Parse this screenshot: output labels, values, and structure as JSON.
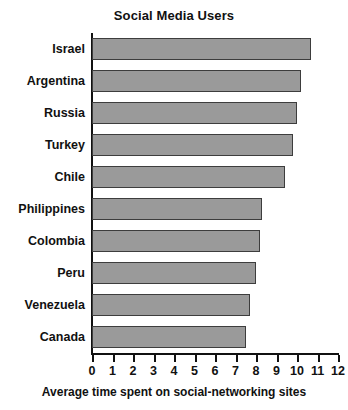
{
  "chart_data": {
    "type": "bar",
    "orientation": "horizontal",
    "title": "Social Media Users",
    "xlabel": "Average time spent on social-networking sites",
    "ylabel": "",
    "xlim": [
      0,
      12
    ],
    "xticks": [
      0,
      1,
      2,
      3,
      4,
      5,
      6,
      7,
      8,
      9,
      10,
      11,
      12
    ],
    "xtick_labels": [
      "0",
      "1",
      "2",
      "3",
      "4",
      "5",
      "6",
      "7",
      "8",
      "9",
      "10",
      "11",
      "12"
    ],
    "grid": false,
    "legend": false,
    "bar_color": "#9a9a9a",
    "bar_edge_color": "#3d3d3d",
    "categories": [
      "Israel",
      "Argentina",
      "Russia",
      "Turkey",
      "Chile",
      "Philippines",
      "Colombia",
      "Peru",
      "Venezuela",
      "Canada"
    ],
    "values": [
      10.7,
      10.2,
      10.0,
      9.8,
      9.4,
      8.3,
      8.2,
      8.0,
      7.7,
      7.5
    ],
    "bars": [
      {
        "label": "Israel",
        "value": 10.7
      },
      {
        "label": "Argentina",
        "value": 10.2
      },
      {
        "label": "Russia",
        "value": 10.0
      },
      {
        "label": "Turkey",
        "value": 9.8
      },
      {
        "label": "Chile",
        "value": 9.4
      },
      {
        "label": "Philippines",
        "value": 8.3
      },
      {
        "label": "Colombia",
        "value": 8.2
      },
      {
        "label": "Peru",
        "value": 8.0
      },
      {
        "label": "Venezuela",
        "value": 7.7
      },
      {
        "label": "Canada",
        "value": 7.5
      }
    ]
  }
}
